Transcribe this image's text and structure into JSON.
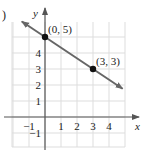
{
  "figure": {
    "part_marker": ")"
  },
  "chart_data": {
    "type": "line",
    "title": "",
    "xlabel": "x",
    "ylabel": "y",
    "xlim": [
      -2,
      5
    ],
    "ylim": [
      -2,
      6
    ],
    "grid": true,
    "x_ticks": [
      "-1",
      "1",
      "2",
      "3",
      "4"
    ],
    "y_ticks": [
      "-1",
      "1",
      "2",
      "3",
      "4"
    ],
    "series": [
      {
        "name": "line",
        "points": [
          {
            "x": 0,
            "y": 5,
            "label": "(0, 5)"
          },
          {
            "x": 3,
            "y": 3,
            "label": "(3, 3)"
          }
        ],
        "slope": -0.6667,
        "intercept": 5,
        "arrows_both_ends": true
      }
    ],
    "colors": {
      "line": "#666666",
      "point": "#111111",
      "grid": "#dddddd",
      "axis": "#555555"
    }
  }
}
